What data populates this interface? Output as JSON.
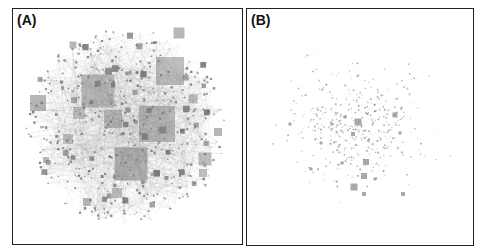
{
  "figure": {
    "panels": [
      {
        "id": "A",
        "label": "(A)",
        "description": "dense network graph with many nodes and edges; nodes drawn as grey squares sized by degree"
      },
      {
        "id": "B",
        "label": "(B)",
        "description": "sparse network graph; scattered small nodes with a few larger hub nodes"
      }
    ],
    "colors": {
      "node": "#707070",
      "edge": "#9a9a9a",
      "frame": "#222222",
      "background": "#ffffff"
    }
  }
}
